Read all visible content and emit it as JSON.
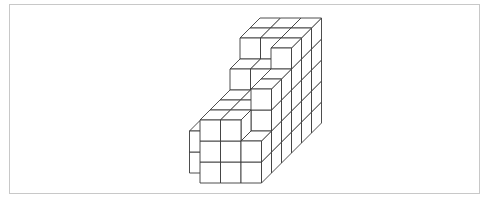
{
  "figure": {
    "colors": {
      "stroke": "#3a3a3a",
      "face": "#ffffff",
      "frame": "#c8c8c8"
    },
    "projection": {
      "origin_x": 200,
      "origin_y": 183,
      "cube_w": 20.5,
      "cube_h": 21,
      "depth_dx": 10,
      "depth_dy": -10
    },
    "heightmap": {
      "note": "columns[x] per row z (z=0 front); x index starts at -1",
      "x_start": -1,
      "rows": [
        [
          0,
          3,
          3,
          2
        ],
        [
          2,
          3,
          3,
          4
        ],
        [
          0,
          3,
          3,
          4
        ],
        [
          0,
          4,
          4,
          5
        ],
        [
          0,
          5,
          5,
          5
        ],
        [
          0,
          5,
          5,
          5
        ]
      ]
    }
  }
}
